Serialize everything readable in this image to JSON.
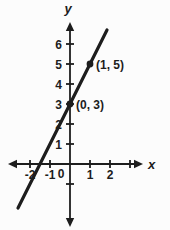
{
  "figure": {
    "background": "#fcfcfc",
    "ink_color": "#1d1d1d"
  },
  "chart_data": {
    "type": "line",
    "title": "",
    "xlabel": "x",
    "ylabel": "y",
    "origin_label": "0",
    "grid": false,
    "xlim": [
      -3.5,
      5.0
    ],
    "ylim": [
      -3.3,
      8.2
    ],
    "series": [
      {
        "name": "line-through-points",
        "x": [
          -2.6,
          1.85
        ],
        "y": [
          -2.2,
          6.7
        ]
      }
    ],
    "points": [
      {
        "x": 1,
        "y": 5,
        "label": "(1, 5)"
      },
      {
        "x": 0,
        "y": 3,
        "label": "(0, 3)"
      }
    ],
    "x_ticks": [
      -2,
      -1,
      1,
      2,
      3
    ],
    "x_tick_labels": [
      "-2",
      "-1",
      "1",
      "2",
      ""
    ],
    "y_ticks": [
      6,
      5,
      4,
      3,
      2,
      1,
      -1
    ],
    "y_tick_labels": [
      "6",
      "5",
      "4",
      "3",
      "2",
      "1",
      ""
    ]
  }
}
